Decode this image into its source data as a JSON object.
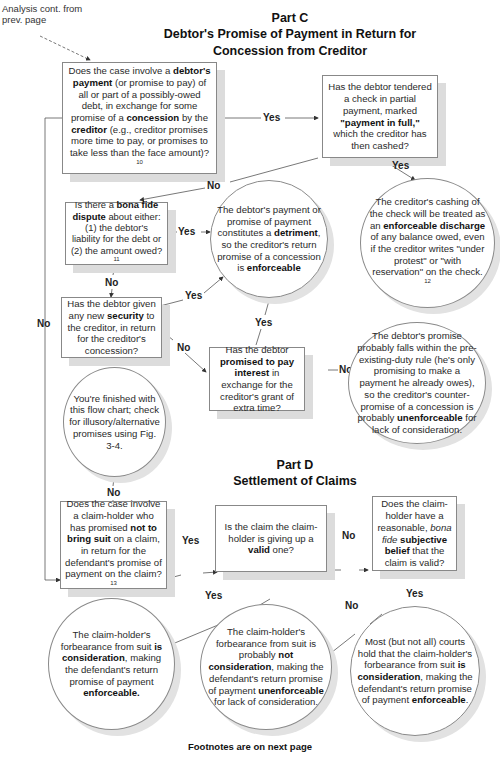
{
  "annotation": {
    "line1": "Analysis cont. from",
    "line2": "prev. page"
  },
  "part_c": {
    "heading": "Part C",
    "subtitle_line1": "Debtor's Promise of Payment in Return for",
    "subtitle_line2": "Concession from Creditor"
  },
  "part_d": {
    "heading": "Part D",
    "subtitle": "Settlement of Claims"
  },
  "nodes": {
    "q_debtor_payment": {
      "t1": "Does the case involve a ",
      "b1": "debtor's payment",
      "t2": " (or promise to pay) of all or part of a possibly-owed debt, in exchange for some promise of a ",
      "b2": "concession",
      "t3": " by the ",
      "b3": "creditor",
      "t4": " (e.g., creditor promises more time to pay,  or promises to take less than the face amount)?",
      "fn": "10"
    },
    "q_check_partial": {
      "t1": "Has the debtor tendered a check in partial payment,  marked ",
      "b1": "\"payment in full,\"",
      "t2": " which the creditor has then cashed?"
    },
    "c_enforceable_discharge": {
      "t1": "The creditor's cashing of the check will be treated as an ",
      "b1": "enforceable discharge",
      "t2": " of any balance owed, even if the creditor writes \"under protest\" or \"with reservation\" on the check.",
      "fn": "12"
    },
    "q_bona_fide_dispute": {
      "t1": "Is there a ",
      "b1": "bona fide dispute",
      "t2": " about either: (1) the debtor's liability for the debt or (2) the amount owed?",
      "fn": "11"
    },
    "c_detriment": {
      "t1": "The debtor's payment or promise of payment constitutes a ",
      "b1": "detriment",
      "t2": ", so the creditor's return promise of a concession  is ",
      "b2": "enforceable"
    },
    "q_new_security": {
      "t1": "Has the debtor given any new ",
      "b1": "security",
      "t2": " to the creditor, in return for the creditor's concession?"
    },
    "q_promise_interest": {
      "t1": "Has the debtor ",
      "b1": "promised to pay interest",
      "t2": " in exchange for the creditor's grant of extra time?"
    },
    "c_pre_existing_duty": {
      "t1": "The debtor's promise probably  falls within the pre-existing-duty rule (he's only promising to make a payment he already owes), so the creditor's counter-promise of a concession is probably ",
      "b1": "unenforceable",
      "t2": " for lack of consideration."
    },
    "c_finished": {
      "t1": "You're finished with this flow chart; check for illusory/alternative promises using Fig. 3-4."
    },
    "q_not_to_sue": {
      "t1": "Does the case involve a claim-holder who has promised ",
      "b1": "not to bring suit",
      "t2": " on a claim, in return for the defendant's promise of payment on the claim?",
      "fn": "13"
    },
    "q_valid_claim": {
      "t1": "Is the claim the claim-holder is giving up a ",
      "b1": "valid",
      "t2": " one?"
    },
    "q_subjective_belief": {
      "t1": "Does the claim-holder have a reasonable, ",
      "i1": "bona fide",
      "t2": " ",
      "b1": "subjective belief",
      "t3": " that the claim is valid?"
    },
    "c_is_consideration": {
      "t1": "The claim-holder's forbearance from suit ",
      "b1": "is consideration",
      "t2": ", making the defendant's return promise of payment ",
      "b2": "enforceable."
    },
    "c_not_consideration": {
      "t1": "The claim-holder's forbearance from suit is probably ",
      "b1": "not consideration",
      "t2": ", making the defendant's return promise of payment ",
      "b2": "unenforceable",
      "t3": " for lack of consideration."
    },
    "c_most_courts": {
      "t1": "Most (but not all) courts hold that the claim-holder's forbearance from suit ",
      "b1": "is consideration",
      "t2": ", making the defendant's return promise of payment ",
      "b2": "enforceable",
      "t3": "."
    }
  },
  "edge_labels": {
    "yes": "Yes",
    "no": "No"
  },
  "footer": "Footnotes are on next page"
}
